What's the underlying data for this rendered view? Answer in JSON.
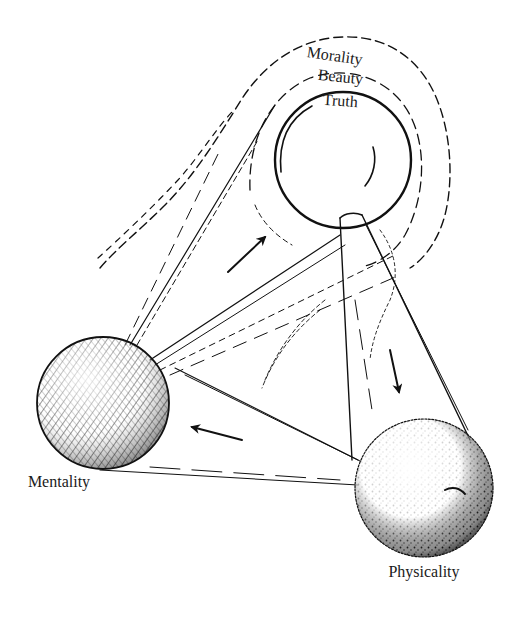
{
  "diagram": {
    "type": "concept-diagram",
    "style": "hand-drawn pen-and-ink illustration",
    "nodes": [
      {
        "id": "ideal",
        "shape": "circle with nested scalloped halos",
        "halo_labels": [
          "Morality",
          "Beauty",
          "Truth"
        ]
      },
      {
        "id": "mentality",
        "shape": "textured sphere",
        "label": "Mentality"
      },
      {
        "id": "physicality",
        "shape": "stippled sphere",
        "label": "Physicality"
      }
    ],
    "labels": {
      "morality": "Morality",
      "beauty": "Beauty",
      "truth": "Truth",
      "mentality": "Mentality",
      "physicality": "Physicality"
    },
    "arrows": [
      {
        "from": "mentality",
        "to": "ideal",
        "direction": "up-right"
      },
      {
        "from": "ideal",
        "to": "physicality",
        "direction": "down"
      },
      {
        "from": "physicality",
        "to": "mentality",
        "direction": "left"
      }
    ],
    "colors": {
      "ink": "#111111",
      "paper": "#ffffff"
    }
  }
}
